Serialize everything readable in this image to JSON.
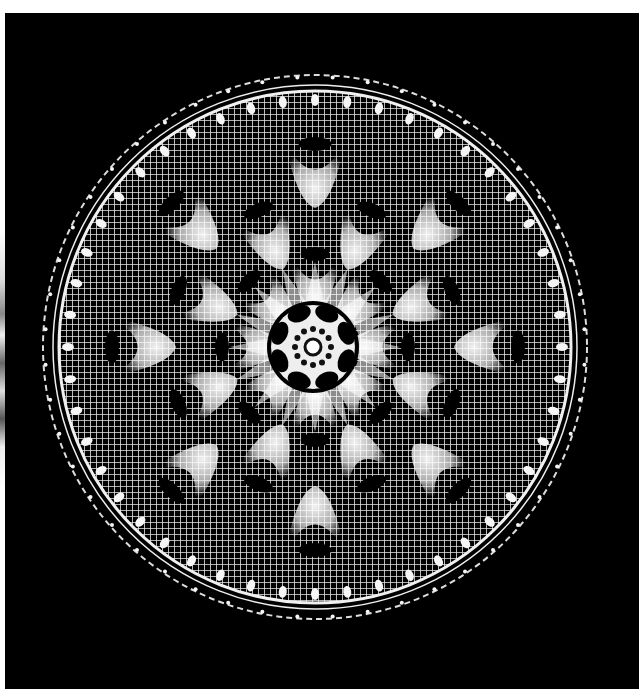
{
  "image": {
    "subject": "crocheted doily",
    "description": "White circular filet-crochet doily with pineapple/petal motifs and dark oval holes, photographed on a black background",
    "colors": {
      "background_page": "#ffffff",
      "photo_background": "#000000",
      "thread": "#f2f2f2"
    },
    "motifs": {
      "center_rosette_petals": 8,
      "inner_ring_holes": 8,
      "middle_ring_holes": 8,
      "outer_ring_holes": 8,
      "scalloped_edge_points": 48
    }
  }
}
